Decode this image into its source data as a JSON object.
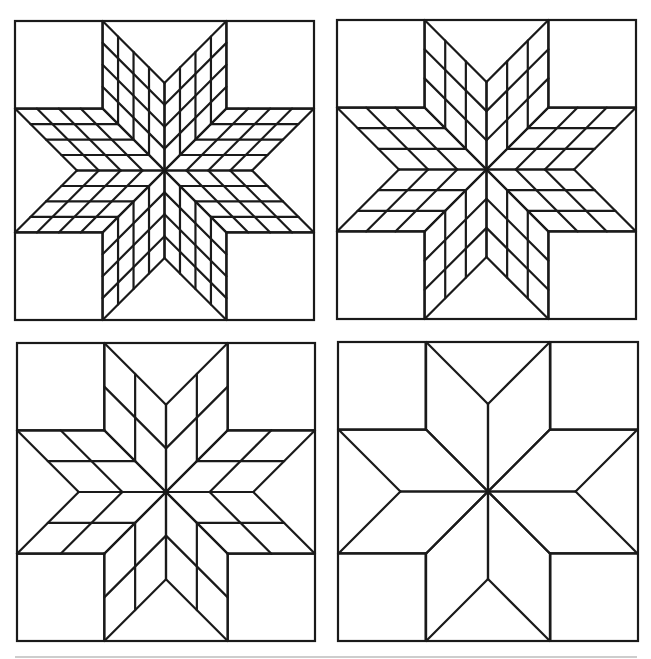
{
  "figure": {
    "title": "Lemoyne star quilt block variations",
    "stroke_color": "#1a1a1a",
    "background_color": "#ffffff",
    "rule_color": "#bdbdbd",
    "stroke_width": 2.2,
    "rule": {
      "x1": 15,
      "x2": 637,
      "y": 657
    }
  },
  "blocks": [
    {
      "name": "star-block-4x4",
      "label": "Lemoyne star, 16 pieces per diamond",
      "grid_divisions": 4,
      "x": 15,
      "y": 21,
      "width": 299,
      "height": 299,
      "center": [
        164,
        170
      ]
    },
    {
      "name": "star-block-3x3",
      "label": "Lemoyne star, 9 pieces per diamond",
      "grid_divisions": 3,
      "x": 337,
      "y": 20,
      "width": 299,
      "height": 299,
      "center": [
        486.5,
        169.5
      ]
    },
    {
      "name": "star-block-2x2",
      "label": "Lemoyne star, 4 pieces per diamond",
      "grid_divisions": 2,
      "x": 17,
      "y": 343,
      "width": 298,
      "height": 298,
      "center": [
        166,
        492
      ]
    },
    {
      "name": "star-block-1x1",
      "label": "Lemoyne star, single-piece diamonds",
      "grid_divisions": 1,
      "x": 338,
      "y": 342,
      "width": 300,
      "height": 299,
      "center": [
        488,
        491.5
      ]
    }
  ]
}
